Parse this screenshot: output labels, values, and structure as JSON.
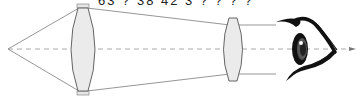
{
  "diagram": {
    "type": "optics-ray-diagram",
    "truncated_caption": "63 ? 38 42 3 ? ? ? ?",
    "colors": {
      "ray": "#8a8a8a",
      "axis": "#9a9a9a",
      "lens_fill": "#ececec",
      "lens_stroke": "#666666",
      "eye": "#111111"
    },
    "elements": [
      {
        "name": "point-source",
        "x": 8,
        "y": 49
      },
      {
        "name": "objective-lens",
        "cx": 83,
        "top": 5,
        "bottom": 95
      },
      {
        "name": "focal-point",
        "x": 173,
        "y": 49
      },
      {
        "name": "eyepiece-lens",
        "cx": 233,
        "top": 24,
        "bottom": 76
      },
      {
        "name": "eye",
        "x": 275,
        "y": 20
      }
    ]
  }
}
